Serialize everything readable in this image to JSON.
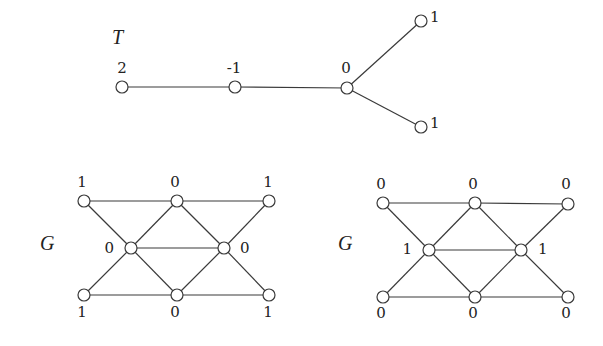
{
  "tree": {
    "title": "T",
    "title_pos": [
      112,
      44
    ],
    "nodes": [
      {
        "id": "t0",
        "x": 122,
        "y": 87,
        "label": "2",
        "lx": 122,
        "ly": 73,
        "anchor": "middle"
      },
      {
        "id": "t1",
        "x": 235,
        "y": 87,
        "label": "-1",
        "lx": 234,
        "ly": 73,
        "anchor": "middle"
      },
      {
        "id": "t2",
        "x": 347,
        "y": 88,
        "label": "0",
        "lx": 346,
        "ly": 73,
        "anchor": "middle"
      },
      {
        "id": "t3",
        "x": 421,
        "y": 21,
        "label": "1",
        "lx": 430,
        "ly": 22,
        "anchor": "start"
      },
      {
        "id": "t4",
        "x": 421,
        "y": 127,
        "label": "1",
        "lx": 430,
        "ly": 128,
        "anchor": "start"
      }
    ],
    "edges": [
      [
        "t0",
        "t1"
      ],
      [
        "t1",
        "t2"
      ],
      [
        "t2",
        "t3"
      ],
      [
        "t2",
        "t4"
      ]
    ]
  },
  "graphs": [
    {
      "title": "G",
      "title_pos": [
        40,
        250
      ],
      "nodes": [
        {
          "id": "a",
          "x": 84,
          "y": 201,
          "label": "1",
          "lx": 82,
          "ly": 187,
          "anchor": "middle"
        },
        {
          "id": "b",
          "x": 177,
          "y": 201,
          "label": "0",
          "lx": 175,
          "ly": 187,
          "anchor": "middle"
        },
        {
          "id": "c",
          "x": 269,
          "y": 201,
          "label": "1",
          "lx": 268,
          "ly": 187,
          "anchor": "middle"
        },
        {
          "id": "d",
          "x": 131,
          "y": 248,
          "label": "0",
          "lx": 114,
          "ly": 253,
          "anchor": "end"
        },
        {
          "id": "e",
          "x": 224,
          "y": 248,
          "label": "0",
          "lx": 240,
          "ly": 253,
          "anchor": "start"
        },
        {
          "id": "f",
          "x": 84,
          "y": 295,
          "label": "1",
          "lx": 82,
          "ly": 317,
          "anchor": "middle"
        },
        {
          "id": "g",
          "x": 177,
          "y": 295,
          "label": "0",
          "lx": 175,
          "ly": 317,
          "anchor": "middle"
        },
        {
          "id": "h",
          "x": 269,
          "y": 295,
          "label": "1",
          "lx": 268,
          "ly": 317,
          "anchor": "middle"
        }
      ],
      "edges": [
        [
          "a",
          "b"
        ],
        [
          "b",
          "c"
        ],
        [
          "a",
          "d"
        ],
        [
          "b",
          "d"
        ],
        [
          "b",
          "e"
        ],
        [
          "c",
          "e"
        ],
        [
          "d",
          "e"
        ],
        [
          "d",
          "f"
        ],
        [
          "d",
          "g"
        ],
        [
          "e",
          "g"
        ],
        [
          "e",
          "h"
        ],
        [
          "f",
          "g"
        ],
        [
          "g",
          "h"
        ]
      ]
    },
    {
      "title": "G",
      "title_pos": [
        338,
        250
      ],
      "nodes": [
        {
          "id": "a",
          "x": 383,
          "y": 203,
          "label": "0",
          "lx": 381,
          "ly": 189,
          "anchor": "middle"
        },
        {
          "id": "b",
          "x": 475,
          "y": 203,
          "label": "0",
          "lx": 473,
          "ly": 189,
          "anchor": "middle"
        },
        {
          "id": "c",
          "x": 568,
          "y": 204,
          "label": "0",
          "lx": 566,
          "ly": 189,
          "anchor": "middle"
        },
        {
          "id": "d",
          "x": 429,
          "y": 250,
          "label": "1",
          "lx": 412,
          "ly": 254,
          "anchor": "end"
        },
        {
          "id": "e",
          "x": 521,
          "y": 250,
          "label": "1",
          "lx": 538,
          "ly": 254,
          "anchor": "start"
        },
        {
          "id": "f",
          "x": 383,
          "y": 297,
          "label": "0",
          "lx": 381,
          "ly": 318,
          "anchor": "middle"
        },
        {
          "id": "g",
          "x": 475,
          "y": 297,
          "label": "0",
          "lx": 473,
          "ly": 318,
          "anchor": "middle"
        },
        {
          "id": "h",
          "x": 568,
          "y": 297,
          "label": "0",
          "lx": 566,
          "ly": 318,
          "anchor": "middle"
        }
      ],
      "edges": [
        [
          "a",
          "b"
        ],
        [
          "b",
          "c"
        ],
        [
          "a",
          "d"
        ],
        [
          "b",
          "d"
        ],
        [
          "b",
          "e"
        ],
        [
          "c",
          "e"
        ],
        [
          "d",
          "e"
        ],
        [
          "d",
          "f"
        ],
        [
          "d",
          "g"
        ],
        [
          "e",
          "g"
        ],
        [
          "e",
          "h"
        ],
        [
          "f",
          "g"
        ],
        [
          "g",
          "h"
        ]
      ]
    }
  ],
  "style": {
    "node_radius": 6,
    "stroke_color": "#3a3a3a",
    "background": "#ffffff"
  }
}
